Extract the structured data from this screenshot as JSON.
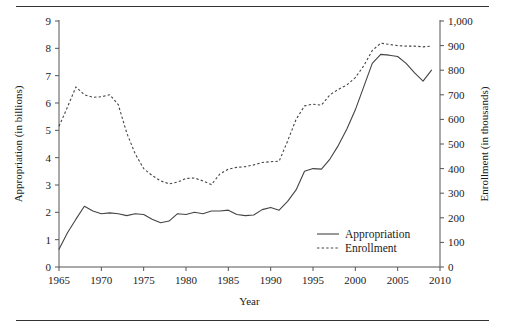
{
  "chart_data": {
    "type": "line",
    "title": "",
    "xlabel": "Year",
    "ylabel": "Appropriation (in billions)",
    "y2label": "Enrollment (in thousands)",
    "xlim": [
      1965,
      2010
    ],
    "ylim": [
      0,
      9
    ],
    "y2lim": [
      0,
      1000
    ],
    "grid": false,
    "legend_position": "bottom-right",
    "xticks": [
      "1965",
      "1970",
      "1975",
      "1980",
      "1985",
      "1990",
      "1995",
      "2000",
      "2005",
      "2010"
    ],
    "xtick_values": [
      1965,
      1970,
      1975,
      1980,
      1985,
      1990,
      1995,
      2000,
      2005,
      2010
    ],
    "yticks": [
      "0",
      "1",
      "2",
      "3",
      "4",
      "5",
      "6",
      "7",
      "8",
      "9"
    ],
    "ytick_values": [
      0,
      1,
      2,
      3,
      4,
      5,
      6,
      7,
      8,
      9
    ],
    "y2ticks": [
      "0",
      "100",
      "200",
      "300",
      "400",
      "500",
      "600",
      "700",
      "800",
      "900",
      "1,000"
    ],
    "y2tick_values": [
      0,
      100,
      200,
      300,
      400,
      500,
      600,
      700,
      800,
      900,
      1000
    ],
    "x": [
      1965,
      1966,
      1967,
      1968,
      1969,
      1970,
      1971,
      1972,
      1973,
      1974,
      1975,
      1976,
      1977,
      1978,
      1979,
      1980,
      1981,
      1982,
      1983,
      1984,
      1985,
      1986,
      1987,
      1988,
      1989,
      1990,
      1991,
      1992,
      1993,
      1994,
      1995,
      1996,
      1997,
      1998,
      1999,
      2000,
      2001,
      2002,
      2003,
      2004,
      2005,
      2006,
      2007,
      2008,
      2009
    ],
    "series": [
      {
        "name": "Appropriation",
        "axis": "left",
        "units": "billions",
        "style": "solid",
        "values": [
          0.65,
          1.25,
          1.75,
          2.22,
          2.05,
          1.95,
          1.98,
          1.95,
          1.88,
          1.95,
          1.92,
          1.75,
          1.62,
          1.68,
          1.95,
          1.92,
          2.0,
          1.95,
          2.05,
          2.05,
          2.08,
          1.92,
          1.88,
          1.9,
          2.1,
          2.18,
          2.08,
          2.4,
          2.82,
          3.5,
          3.6,
          3.58,
          3.95,
          4.45,
          5.05,
          5.75,
          6.6,
          7.45,
          7.78,
          7.75,
          7.7,
          7.45,
          7.1,
          6.8,
          7.2
        ]
      },
      {
        "name": "Enrollment",
        "axis": "right",
        "units": "thousands",
        "style": "dashed",
        "values": [
          572,
          650,
          732,
          700,
          690,
          692,
          700,
          660,
          545,
          460,
          400,
          372,
          350,
          338,
          345,
          360,
          362,
          350,
          335,
          378,
          398,
          405,
          408,
          415,
          425,
          428,
          430,
          512,
          600,
          655,
          662,
          658,
          700,
          722,
          740,
          770,
          818,
          880,
          910,
          905,
          900,
          898,
          898,
          895,
          898
        ]
      }
    ]
  },
  "legend": {
    "items": [
      {
        "label": "Appropriation",
        "style": "solid"
      },
      {
        "label": "Enrollment",
        "style": "dashed"
      }
    ]
  },
  "axes": {
    "left_title": "Appropriation (in billions)",
    "right_title": "Enrollment (in thousands)",
    "bottom_title": "Year"
  }
}
